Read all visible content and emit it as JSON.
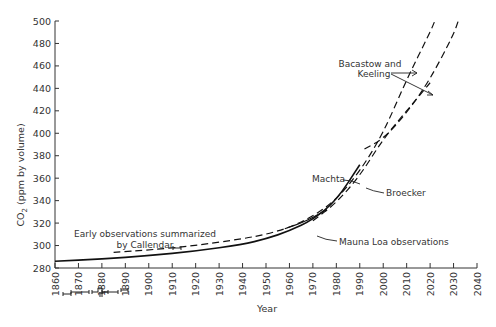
{
  "chart_data": {
    "type": "line",
    "title": "",
    "xlabel": "Year",
    "ylabel": "CO2 (ppm by volume)",
    "xlim": [
      1860,
      2040
    ],
    "ylim": [
      280,
      500
    ],
    "x_ticks": [
      "1860",
      "1870",
      "1880",
      "1890",
      "1900",
      "1910",
      "1920",
      "1930",
      "1940",
      "1950",
      "1960",
      "1970",
      "1980",
      "1990",
      "2000",
      "2010",
      "2020",
      "2030",
      "2040"
    ],
    "y_ticks": [
      "280",
      "300",
      "320",
      "340",
      "360",
      "380",
      "400",
      "420",
      "440",
      "460",
      "480",
      "500"
    ],
    "grid": false,
    "legend": "none (inline annotations)",
    "series": [
      {
        "name": "Machta",
        "style": "solid",
        "x": [
          1860,
          1880,
          1900,
          1920,
          1940,
          1950,
          1960,
          1970,
          1980,
          1990
        ],
        "y": [
          286,
          288,
          291,
          295,
          301,
          306,
          313,
          323,
          340,
          372
        ]
      },
      {
        "name": "Bacastow and Keeling (upper)",
        "style": "dashed",
        "x": [
          1885,
          1900,
          1920,
          1940,
          1950,
          1960,
          1970,
          1980,
          1990,
          2000,
          2010,
          2020,
          2022
        ],
        "y": [
          294,
          296,
          300,
          306,
          310,
          316,
          326,
          341,
          366,
          400,
          448,
          490,
          500
        ]
      },
      {
        "name": "Bacastow and Keeling (lower)",
        "style": "dashed",
        "x": [
          1992,
          2000,
          2010,
          2020,
          2030,
          2032
        ],
        "y": [
          386,
          395,
          418,
          448,
          488,
          500
        ]
      },
      {
        "name": "Broecker",
        "style": "dashed",
        "x": [
          1970,
          1980,
          1990,
          2000,
          2010,
          2020
        ],
        "y": [
          322,
          338,
          362,
          395,
          420,
          445
        ]
      },
      {
        "name": "Mauna Loa observations",
        "style": "solid-short",
        "x": [
          1958,
          1965,
          1970,
          1976
        ],
        "y": [
          315,
          320,
          325,
          332
        ]
      }
    ],
    "annotations": [
      {
        "text_lines": [
          "Early observations summarized",
          "by Callendar"
        ],
        "x": 1885,
        "y": 313
      },
      {
        "text_lines": [
          "Bacastow and",
          "Keeling"
        ],
        "x": 2012,
        "y": 464
      },
      {
        "text_lines": [
          "Machta"
        ],
        "x": 1986,
        "y": 373
      },
      {
        "text_lines": [
          "Broecker"
        ],
        "x": 2000,
        "y": 363
      },
      {
        "text_lines": [
          "Mauna Loa observations"
        ],
        "x": 1988,
        "y": 315
      }
    ]
  },
  "labels": {
    "ylabel_main": "CO",
    "ylabel_sub": "2",
    "ylabel_rest": " (ppm by volume)",
    "xlabel": "Year",
    "callendar_line1": "Early observations summarized",
    "callendar_line2": "by Callendar",
    "bk_line1": "Bacastow and",
    "bk_line2": "Keeling",
    "machta": "Machta",
    "broecker": "Broecker",
    "mauna_loa": "Mauna Loa observations"
  }
}
